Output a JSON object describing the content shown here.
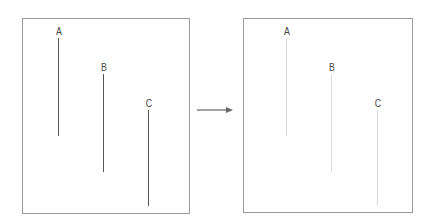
{
  "left_panel": {
    "box": {
      "x": 22,
      "y": 18,
      "w": 168,
      "h": 196
    },
    "line_color": "#555555",
    "lines": [
      {
        "label": "A",
        "x": 58,
        "y1": 38,
        "y2": 136
      },
      {
        "label": "B",
        "x": 103,
        "y1": 74,
        "y2": 172
      },
      {
        "label": "C",
        "x": 148,
        "y1": 110,
        "y2": 206
      }
    ]
  },
  "right_panel": {
    "box": {
      "x": 243,
      "y": 18,
      "w": 170,
      "h": 195
    },
    "line_color": "#dcdcdc",
    "lines": [
      {
        "label": "A",
        "x": 286,
        "y1": 38,
        "y2": 136
      },
      {
        "label": "B",
        "x": 331,
        "y1": 74,
        "y2": 172
      },
      {
        "label": "C",
        "x": 377,
        "y1": 110,
        "y2": 206
      }
    ]
  },
  "arrow": {
    "x1": 197,
    "x2": 233,
    "y": 110,
    "color": "#666666"
  }
}
